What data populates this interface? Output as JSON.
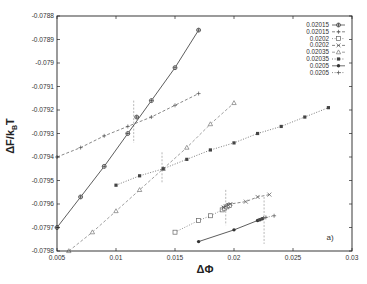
{
  "chart_data": {
    "type": "line",
    "title": "",
    "xlabel": "ΔΦ",
    "ylabel": "ΔF/k_BT",
    "xlim": [
      0.005,
      0.03
    ],
    "ylim": [
      -0.0798,
      -0.0788
    ],
    "xticks": [
      0.005,
      0.01,
      0.015,
      0.02,
      0.025,
      0.03
    ],
    "xtick_labels": [
      "0.005",
      "0.01",
      "0.015",
      "0.02",
      "0.025",
      "0.03"
    ],
    "yticks": [
      -0.0788,
      -0.0789,
      -0.079,
      -0.0791,
      -0.0792,
      -0.0793,
      -0.0794,
      -0.0795,
      -0.0796,
      -0.0797,
      -0.0798
    ],
    "ytick_labels": [
      "-0.0788",
      "-0.0789",
      "-0.079",
      "-0.0791",
      "-0.0792",
      "-0.0793",
      "-0.0794",
      "-0.0795",
      "-0.0796",
      "-0.0797",
      "-0.0798"
    ],
    "grid": false,
    "legend_position": "upper right",
    "annotation": "a)",
    "series": [
      {
        "name": "0.02015",
        "line": "solid",
        "marker": "circle-plus",
        "color": "#333333",
        "x": [
          0.005,
          0.007,
          0.009,
          0.011,
          0.013,
          0.015,
          0.017
        ],
        "y": [
          -0.0797,
          -0.07957,
          -0.07944,
          -0.0793,
          -0.07916,
          -0.07902,
          -0.07886
        ]
      },
      {
        "name": "0.02015",
        "line": "dashed",
        "marker": "plus",
        "color": "#555555",
        "x": [
          0.005,
          0.007,
          0.009,
          0.011,
          0.013,
          0.015,
          0.017
        ],
        "y": [
          -0.0794,
          -0.07936,
          -0.07931,
          -0.07927,
          -0.07923,
          -0.07918,
          -0.07913
        ]
      },
      {
        "name": "0.0202",
        "line": "dotted",
        "marker": "open-square",
        "color": "#666666",
        "x": [
          0.015,
          0.017,
          0.018,
          0.019,
          0.0192,
          0.0194,
          0.0196
        ],
        "y": [
          -0.07972,
          -0.07967,
          -0.07965,
          -0.079625,
          -0.079618,
          -0.079612,
          -0.079606
        ]
      },
      {
        "name": "0.0202",
        "line": "dashed",
        "marker": "cross",
        "color": "#555555",
        "x": [
          0.0191,
          0.0193,
          0.0195,
          0.0197,
          0.021,
          0.022,
          0.023
        ],
        "y": [
          -0.079615,
          -0.07961,
          -0.079605,
          -0.0796,
          -0.07959,
          -0.07957,
          -0.07956
        ]
      },
      {
        "name": "0.02035",
        "line": "dashed",
        "marker": "triangle",
        "color": "#777777",
        "x": [
          0.006,
          0.008,
          0.01,
          0.012,
          0.014,
          0.016,
          0.018,
          0.02
        ],
        "y": [
          -0.0798,
          -0.07972,
          -0.07963,
          -0.07954,
          -0.07945,
          -0.07936,
          -0.07926,
          -0.07917
        ]
      },
      {
        "name": "0.02035",
        "line": "dotted",
        "marker": "filled-square",
        "color": "#444444",
        "x": [
          0.01,
          0.012,
          0.014,
          0.016,
          0.018,
          0.02,
          0.022,
          0.024,
          0.026,
          0.028
        ],
        "y": [
          -0.07952,
          -0.07948,
          -0.07945,
          -0.07941,
          -0.07937,
          -0.07934,
          -0.0793,
          -0.07927,
          -0.07923,
          -0.07919
        ]
      },
      {
        "name": "0.0205",
        "line": "solid",
        "marker": "filled-circle",
        "color": "#333333",
        "x": [
          0.017,
          0.02,
          0.022,
          0.0222,
          0.0224
        ],
        "y": [
          -0.07976,
          -0.07971,
          -0.07967,
          -0.079667,
          -0.079663
        ]
      },
      {
        "name": "0.0205",
        "line": "dotted",
        "marker": "plus",
        "color": "#555555",
        "x": [
          0.0221,
          0.0223,
          0.0225,
          0.0227,
          0.0234
        ],
        "y": [
          -0.079668,
          -0.079664,
          -0.07966,
          -0.079657,
          -0.07965
        ]
      }
    ],
    "crossings": [
      {
        "pair": "0.02015",
        "x": 0.0115,
        "y": -0.07923,
        "y_range": [
          -0.07934,
          -0.07916
        ]
      },
      {
        "pair": "0.02035",
        "x": 0.0139,
        "y": -0.07945,
        "y_range": [
          -0.07951,
          -0.07938
        ]
      },
      {
        "pair": "0.0202",
        "x": 0.0193,
        "y": -0.07961,
        "y_range": [
          -0.07969,
          -0.07954
        ]
      },
      {
        "pair": "0.0205",
        "x": 0.02255,
        "y": -0.079662,
        "y_range": [
          -0.07977,
          -0.07957
        ]
      }
    ]
  }
}
